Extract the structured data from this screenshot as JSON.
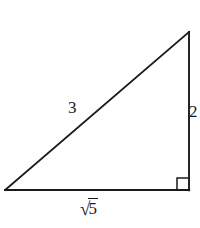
{
  "figure": {
    "kind": "right-triangle-diagram",
    "background_color": "#ffffff",
    "stroke_color": "#1a1a1a",
    "text_color": "#1a1a1a",
    "labels": {
      "hypotenuse": "3",
      "vertical_leg": "2",
      "base_radical_sign": "√",
      "base_radicand": "5",
      "base_full": "√5"
    },
    "geometry": {
      "vertex_bottom_left": "(5, 190)",
      "vertex_bottom_right": "(189, 190)",
      "vertex_top_right": "(189, 32)",
      "right_angle_at": "bottom-right",
      "right_angle_marker_size": "12"
    }
  }
}
